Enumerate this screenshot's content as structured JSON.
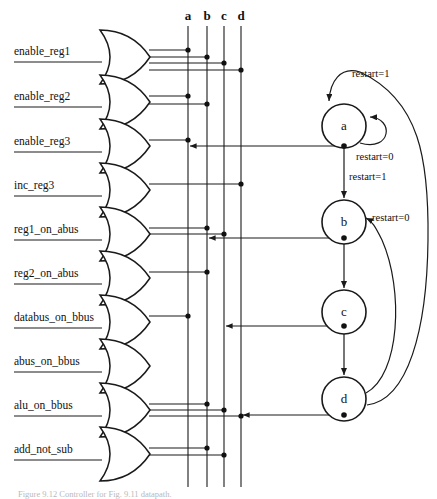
{
  "figure": {
    "title": "Controller for Fig. 9.11 datapath",
    "caption": "Figure 9.12   Controller for Fig. 9.11 datapath."
  },
  "columns": {
    "labels": [
      "a",
      "b",
      "c",
      "d"
    ],
    "x_positions": [
      188,
      207,
      224,
      241
    ]
  },
  "inputs": [
    {
      "label": "enable_reg1",
      "gate_y": 57,
      "connects": [
        "a",
        "b",
        "c",
        "d"
      ]
    },
    {
      "label": "enable_reg2",
      "gate_y": 102,
      "connects": [
        "a",
        "b"
      ]
    },
    {
      "label": "enable_reg3",
      "gate_y": 146,
      "connects": [
        "a"
      ]
    },
    {
      "label": "inc_reg3",
      "gate_y": 190,
      "connects": [
        "d"
      ]
    },
    {
      "label": "reg1_on_abus",
      "gate_y": 234,
      "connects": [
        "b",
        "c"
      ]
    },
    {
      "label": "reg2_on_abus",
      "gate_y": 278,
      "connects": [
        "b"
      ]
    },
    {
      "label": "databus_on_bbus",
      "gate_y": 322,
      "connects": [
        "a"
      ]
    },
    {
      "label": "abus_on_bbus",
      "gate_y": 366,
      "connects": [
        "c"
      ]
    },
    {
      "label": "alu_on_bbus",
      "gate_y": 410,
      "connects": [
        "b",
        "c",
        "d"
      ]
    },
    {
      "label": "add_not_sub",
      "gate_y": 454,
      "connects": [
        "b",
        "c"
      ]
    }
  ],
  "states": [
    {
      "name": "a",
      "cx": 344,
      "cy": 126
    },
    {
      "name": "b",
      "cx": 344,
      "cy": 222
    },
    {
      "name": "c",
      "cx": 344,
      "cy": 312
    },
    {
      "name": "d",
      "cx": 344,
      "cy": 399
    }
  ],
  "transitions": [
    {
      "from": "d",
      "to": "a",
      "condition": "restart=1",
      "label_x": 366,
      "label_y": 77
    },
    {
      "from": "a",
      "to": "a",
      "condition": "restart=0",
      "label_x": 362,
      "label_y": 160
    },
    {
      "from": "a",
      "to": "b",
      "condition": "restart=1",
      "label_x": 349,
      "label_y": 181
    },
    {
      "from": "d",
      "to": "b",
      "condition": "restart=0",
      "label_x": 375,
      "label_y": 221
    },
    {
      "from": "b",
      "to": "c",
      "condition": ""
    },
    {
      "from": "c",
      "to": "d",
      "condition": ""
    }
  ],
  "state_output_wires": [
    {
      "state": "a",
      "to_input": "enable_reg3",
      "y": 146
    },
    {
      "state": "b",
      "to_input": "reg1_on_abus",
      "y": 238
    },
    {
      "state": "c",
      "to_input": "databus_on_bbus",
      "y": 326
    },
    {
      "state": "d",
      "to_input": "alu_on_bbus",
      "y": 415
    }
  ]
}
